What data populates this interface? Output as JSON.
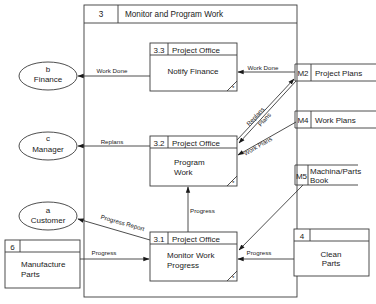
{
  "frame": {
    "id": "3",
    "title": "Monitor and Program Work"
  },
  "processes": [
    {
      "id": "3.3",
      "location": "Project Office",
      "lines": [
        "Notify Finance"
      ]
    },
    {
      "id": "3.2",
      "location": "Project Office",
      "lines": [
        "Program",
        "Work"
      ]
    },
    {
      "id": "3.1",
      "location": "Project Office",
      "lines": [
        "Monitor Work",
        "Progress"
      ]
    }
  ],
  "process_marker": "*",
  "external_entities": [
    {
      "id": "b",
      "name": "Finance"
    },
    {
      "id": "c",
      "name": "Manager"
    },
    {
      "id": "a",
      "name": "Customer"
    }
  ],
  "data_stores": [
    {
      "id": "M2",
      "name": "Project Plans"
    },
    {
      "id": "M4",
      "name": "Work Plans"
    },
    {
      "id": "M5",
      "lines": [
        "Machina/Parts",
        "Book"
      ]
    }
  ],
  "external_processes": [
    {
      "id": "6",
      "lines": [
        "Manufacture",
        "Parts"
      ]
    },
    {
      "id": "4",
      "lines": [
        "Clean",
        "Parts"
      ]
    }
  ],
  "flows": {
    "work_done_to_finance": "Work Done",
    "work_done_from_m2": "Work Done",
    "replans_to_manager": "Replans",
    "replans_to_m2": "Replans",
    "plans_from_m2": "Plans",
    "work_plans_from_m4": "Work Plans",
    "progress_report": "Progress Report",
    "progress_31_to_32": "Progress",
    "progress_from_6": "Progress",
    "progress_from_4": "Progress"
  }
}
